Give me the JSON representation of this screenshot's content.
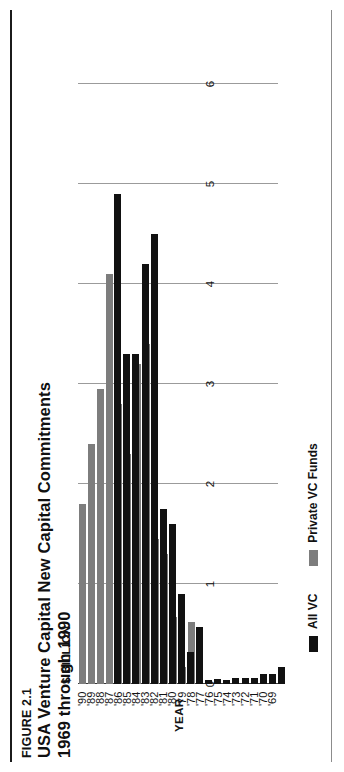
{
  "figure": {
    "number_label": "FIGURE 2.1",
    "title_line1": "USA Venture Capital New Capital Commitments",
    "title_line2": "1969 through 1990"
  },
  "legend": {
    "items": [
      {
        "label": "All VC",
        "color": "#111111",
        "key": "all_vc"
      },
      {
        "label": "Private VC Funds",
        "color": "#7d7d7d",
        "key": "private_vc_funds"
      }
    ]
  },
  "axes": {
    "y_axis_label": "$ BILLION",
    "x_axis_label": "YEAR",
    "y_ticks": [
      "0",
      "1",
      "2",
      "3",
      "4",
      "5",
      "6"
    ],
    "x_ticks": [
      "'69",
      "'70",
      "'71",
      "'72",
      "'73",
      "'74",
      "'75",
      "'76",
      "'77",
      "'78",
      "'79",
      "'80",
      "'81",
      "'82",
      "'83",
      "'84",
      "'85",
      "'86",
      "'87",
      "'88",
      "'89",
      "'90"
    ]
  },
  "chart_data": {
    "type": "bar",
    "orientation": "horizontal",
    "title": "USA Venture Capital New Capital Commitments 1969 through 1990",
    "subtitle": "FIGURE 2.1",
    "xlabel": "YEAR",
    "ylabel": "$ BILLION",
    "ylim": [
      0,
      6
    ],
    "grid": true,
    "grid_axis": "value",
    "legend_position": "bottom-left",
    "categories": [
      "'69",
      "'70",
      "'71",
      "'72",
      "'73",
      "'74",
      "'75",
      "'76",
      "'77",
      "'78",
      "'79",
      "'80",
      "'81",
      "'82",
      "'83",
      "'84",
      "'85",
      "'86",
      "'87",
      "'88",
      "'89",
      "'90"
    ],
    "series": [
      {
        "name": "All VC",
        "color": "#111111",
        "values": [
          0.17,
          0.1,
          0.1,
          0.06,
          0.06,
          0.06,
          0.01,
          0.05,
          0.04,
          0.57,
          0.32,
          0.9,
          1.6,
          1.75,
          4.5,
          4.2,
          3.3,
          3.3,
          4.9,
          0.0,
          0.0,
          0.0
        ]
      },
      {
        "name": "Private VC Funds",
        "color": "#7d7d7d",
        "values": [
          0.0,
          0.0,
          0.0,
          0.0,
          0.0,
          0.0,
          0.0,
          0.0,
          0.0,
          0.62,
          0.17,
          0.67,
          1.3,
          1.45,
          3.4,
          3.2,
          2.3,
          2.8,
          4.1,
          2.95,
          2.4,
          1.8
        ]
      }
    ]
  }
}
